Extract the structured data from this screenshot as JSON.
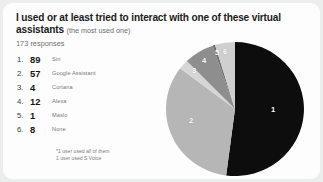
{
  "card": {
    "title_main": "I used or at least tried to interact with one of these virtual assistants",
    "title_note": "(the most used one)",
    "responses": "173 responses",
    "footnote_line1": "*1 user used all of them",
    "footnote_line2": "1 user used S Voice"
  },
  "legend": [
    {
      "rank": "1.",
      "value": "89",
      "label": "Siri"
    },
    {
      "rank": "2.",
      "value": "57",
      "label": "Google Assistant"
    },
    {
      "rank": "3.",
      "value": "4",
      "label": "Cortana"
    },
    {
      "rank": "4.",
      "value": "12",
      "label": "Alexa"
    },
    {
      "rank": "5.",
      "value": "1",
      "label": "Maslo"
    },
    {
      "rank": "6.",
      "value": "8",
      "label": "None"
    }
  ],
  "pie_labels": {
    "s1": "1",
    "s2": "2",
    "s3": "3",
    "s4": "4",
    "s5": "5",
    "s6": "6"
  },
  "colors": {
    "background": "#eceded",
    "card": "#fdfdfd",
    "slice1": "#0d0d0d",
    "slice2": "#b6b6b6",
    "slice3": "#d6d6d6",
    "slice4": "#8e8e8e",
    "slice5": "#6f6f6f",
    "slice6": "#cfcfcf",
    "label_text": "#ffffff"
  },
  "chart_data": {
    "type": "pie",
    "title": "I used or at least tried to interact with one of these virtual assistants (the most used one)",
    "subtitle": "173 responses",
    "categories": [
      "Siri",
      "Google Assistant",
      "Cortana",
      "Alexa",
      "Maslo",
      "None"
    ],
    "values": [
      89,
      57,
      4,
      12,
      1,
      8
    ],
    "total": 171,
    "slice_numbers": [
      1,
      2,
      3,
      4,
      5,
      6
    ],
    "percentages": [
      52.0,
      33.3,
      2.3,
      7.0,
      0.6,
      4.7
    ],
    "colors": [
      "#0d0d0d",
      "#b6b6b6",
      "#d6d6d6",
      "#8e8e8e",
      "#6f6f6f",
      "#cfcfcf"
    ],
    "legend": "left list with rank and count",
    "grid": false,
    "annotations": [
      "*1 user used all of them",
      "1 user used S Voice"
    ],
    "xlabel": "",
    "ylabel": ""
  }
}
